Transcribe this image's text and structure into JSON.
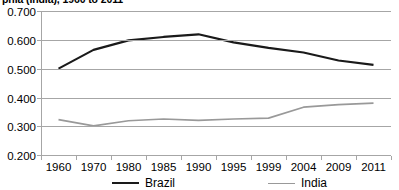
{
  "chart_data": {
    "type": "line",
    "title": "phia (India), 1960 to 2011",
    "xlabel": "",
    "ylabel": "",
    "categories": [
      "1960",
      "1970",
      "1980",
      "1985",
      "1990",
      "1995",
      "1999",
      "2004",
      "2009",
      "2011"
    ],
    "ylim": [
      0.2,
      0.7
    ],
    "y_ticks": [
      "0.200",
      "0.300",
      "0.400",
      "0.500",
      "0.600",
      "0.700"
    ],
    "grid": true,
    "legend_position": "bottom",
    "series": [
      {
        "name": "Brazil",
        "color": "#1a1a1a",
        "values": [
          0.5,
          0.565,
          0.598,
          0.61,
          0.619,
          0.591,
          0.572,
          0.556,
          0.528,
          0.513
        ]
      },
      {
        "name": "India",
        "color": "#999999",
        "values": [
          0.323,
          0.301,
          0.319,
          0.325,
          0.32,
          0.325,
          0.328,
          0.366,
          0.375,
          0.38
        ]
      }
    ]
  }
}
